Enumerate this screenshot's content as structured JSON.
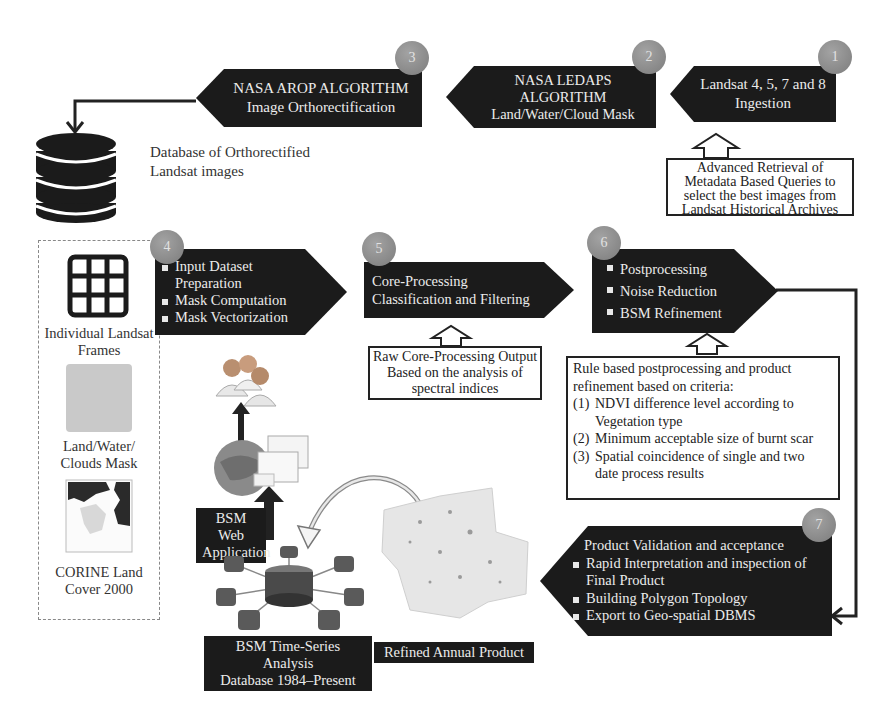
{
  "steps": [
    {
      "number": "1",
      "label": "Landsat 4, 5, 7 and 8 Ingestion",
      "lines": [
        "Landsat 4, 5, 7 and 8",
        "Ingestion"
      ]
    },
    {
      "number": "2",
      "lines": [
        "NASA LEDAPS",
        "ALGORITHM",
        "Land/Water/Cloud Mask"
      ]
    },
    {
      "number": "3",
      "lines": [
        "NASA AROP ALGORITHM",
        "Image Orthorectification"
      ]
    },
    {
      "number": "4",
      "bullets": [
        "Input Dataset Preparation",
        "Mask Computation",
        "Mask Vectorization"
      ]
    },
    {
      "number": "5",
      "lines": [
        "Core-Processing",
        "Classification and Filtering"
      ]
    },
    {
      "number": "6",
      "bullets": [
        "Postprocessing",
        "Noise Reduction",
        "BSM Refinement"
      ]
    },
    {
      "number": "7",
      "title": "Product Validation and acceptance",
      "bullets": [
        "Rapid Interpretation and inspection of Final Product",
        "Building Polygon Topology",
        "Export to Geo-spatial DBMS"
      ]
    }
  ],
  "notes": {
    "retrieval": [
      "Advanced Retrieval of",
      "Metadata Based Queries to",
      "select the best images from",
      "Landsat Historical Archives"
    ],
    "raw_output": [
      "Raw Core-Processing Output",
      "Based on the analysis of",
      "spectral indices"
    ],
    "rules": {
      "intro": [
        "Rule based postprocessing and product",
        "refinement based on criteria:"
      ],
      "items": [
        {
          "num": "(1)",
          "lines": [
            "NDVI difference level according to",
            "Vegetation type"
          ]
        },
        {
          "num": "(2)",
          "lines": [
            "Minimum acceptable size of burnt scar"
          ]
        },
        {
          "num": "(3)",
          "lines": [
            "Spatial coincidence of single and two",
            "date process results"
          ]
        }
      ]
    }
  },
  "database": {
    "lines": [
      "Database of Orthorectified",
      "Landsat images"
    ]
  },
  "inputs": {
    "frames": [
      "Individual Landsat",
      "Frames"
    ],
    "mask": [
      "Land/Water/",
      "Clouds Mask"
    ],
    "corine": [
      "CORINE Land",
      "Cover 2000"
    ]
  },
  "bottom_labels": {
    "web_app": [
      "BSM Web",
      "Application"
    ],
    "timeseries": [
      "BSM Time-Series Analysis",
      "Database 1984–Present"
    ],
    "refined": "Refined Annual Product"
  },
  "colors": {
    "banner": "#1b1b1b",
    "badge": "#8a8a8a",
    "line": "#222222"
  }
}
